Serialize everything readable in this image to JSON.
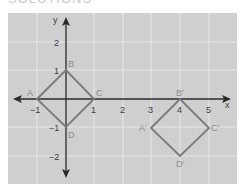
{
  "header": {
    "fragment": "SOLUTIONS"
  },
  "graph": {
    "axis_labels": {
      "x": "x",
      "y": "y"
    },
    "x_ticks": [
      "−1",
      "1",
      "2",
      "3",
      "4",
      "5"
    ],
    "y_ticks": [
      "2",
      "1",
      "−1",
      "−2"
    ],
    "colors": {
      "background": "#cfcfcf",
      "grid": "#e6e6e6",
      "axis": "#2a2a2a",
      "shape": "#7a7a7a",
      "point_label": "#8c8c8c"
    },
    "original": {
      "points": [
        {
          "name": "A",
          "x": -1,
          "y": 0
        },
        {
          "name": "B",
          "x": 0,
          "y": 1
        },
        {
          "name": "C",
          "x": 1,
          "y": 0
        },
        {
          "name": "D",
          "x": 0,
          "y": -1
        }
      ]
    },
    "image": {
      "points": [
        {
          "name": "A′",
          "x": 3,
          "y": -1
        },
        {
          "name": "B′",
          "x": 4,
          "y": 0
        },
        {
          "name": "C′",
          "x": 5,
          "y": -1
        },
        {
          "name": "D′",
          "x": 4,
          "y": -2
        }
      ]
    }
  }
}
